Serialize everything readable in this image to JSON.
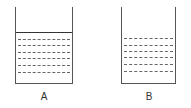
{
  "figure": {
    "containers": [
      {
        "id": "A",
        "label": "A",
        "left": 15,
        "right": 73,
        "top": 7,
        "bottom": 84,
        "has_surface_line": true,
        "surface_y": 32,
        "dashed_lines_y": [
          39,
          45,
          52,
          58,
          65,
          72
        ],
        "label_pos": [
          44,
          96
        ]
      },
      {
        "id": "B",
        "label": "B",
        "left": 121,
        "right": 176,
        "top": 7,
        "bottom": 84,
        "has_surface_line": false,
        "dashed_lines_y": [
          38,
          45,
          51,
          57,
          64,
          71
        ],
        "label_pos": [
          149,
          96
        ]
      }
    ],
    "colors": {
      "wall": "#555555",
      "surface": "#333333",
      "dash": "#666666",
      "label": "#333333"
    }
  }
}
